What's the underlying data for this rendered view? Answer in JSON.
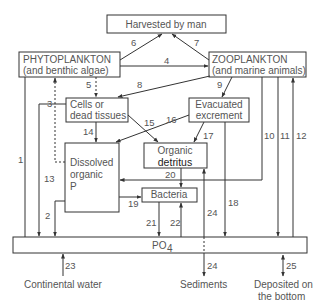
{
  "nodes": {
    "harvested": {
      "label": "Harvested by man"
    },
    "phytoplankton": {
      "line1": "PHYTOPLANKTON",
      "line2": "(and benthic algae)"
    },
    "zooplankton": {
      "line1": "ZOOPLANKTON",
      "line2": "(and marine animals)"
    },
    "cells": {
      "line1": "Cells or",
      "line2": "dead tissues"
    },
    "excrement": {
      "line1": "Evacuated",
      "line2": "excrement"
    },
    "detritus": {
      "line1": "Organic",
      "line2": "detritus"
    },
    "dissolved": {
      "line1": "Dissolved",
      "line2": "organic",
      "line3": "P"
    },
    "bacteria": {
      "label": "Bacteria"
    },
    "po4": {
      "label": "PO",
      "sub": "4"
    }
  },
  "external": {
    "continental": "Continental water",
    "sediments": "Sediments",
    "deposited_line1": "Deposited on",
    "deposited_line2": "the bottom"
  },
  "flows": {
    "f1": "1",
    "f2": "2",
    "f3": "3",
    "f4": "4",
    "f5": "5",
    "f6": "6",
    "f7": "7",
    "f8": "8",
    "f9": "9",
    "f10": "10",
    "f11": "11",
    "f12": "12",
    "f13": "13",
    "f14": "14",
    "f15": "15",
    "f16": "16",
    "f17": "17",
    "f18": "18",
    "f19": "19",
    "f20": "20",
    "f21": "21",
    "f22": "22",
    "f24a": "24",
    "f24b": "24",
    "f23": "23",
    "f25": "25"
  }
}
